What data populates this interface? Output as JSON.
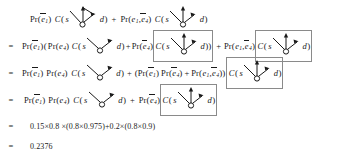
{
  "document": {
    "kind": "mathematical-derivation",
    "ink_color": "#1a1a1a",
    "box_color": "#8a8a8a",
    "background": "#ffffff"
  },
  "symbols": {
    "pr": "Pr",
    "c": "C",
    "e": "e",
    "s": "s",
    "d": "d",
    "sub_1": "1",
    "sub_4": "4",
    "equals": "=",
    "plus": "+",
    "times": "×",
    "comma": ",",
    "lparen": "(",
    "rparen": ")"
  },
  "lines": [
    {
      "id": "line-1",
      "relation": "",
      "text": "Pr(ē1) C( s ↘○↗ d) + Pr(e1,ē4) C( s ↘○↑↗ d)"
    },
    {
      "id": "line-2",
      "relation": "=",
      "text": "Pr(ē1)( Pr(e4) C( s ↘○↗ d)+ Pr(ē4)|C( s ↘○↑↗ d)| ) + Pr(e1,ē4)|C( s ↘○↑↗ d)|"
    },
    {
      "id": "line-3",
      "relation": "=",
      "text": "Pr(ē1) Pr(e4) C( s ↘○↗ d) + (Pr(ē1) Pr(ē4) + Pr(e1,ē4)) C( s ↘○↑↗ d)"
    },
    {
      "id": "line-4",
      "relation": "=",
      "text": "Pr(ē1) Pr(e4) C( s ↘○↗ d) + Pr(ē4) C( s ↘○↑↗ d)"
    },
    {
      "id": "line-5",
      "relation": "=",
      "text": "0.15×0.8 ×(0.8×0.975)+0.2×(0.8×0.9)"
    },
    {
      "id": "line-6",
      "relation": "=",
      "text": "0.2376"
    }
  ],
  "numeric": {
    "expression": "0.15×0.8 ×(0.8×0.975)+0.2×(0.8×0.9)",
    "result": "0.2376",
    "factors": [
      "0.15",
      "0.8",
      "0.8",
      "0.975",
      "0.2",
      "0.8",
      "0.9"
    ]
  },
  "graphs": {
    "triangle": {
      "name": "triangle-graph",
      "source_label": "s",
      "dest_label": "d",
      "node": "○",
      "arrows": [
        "s-down-right",
        "up",
        "up-right-to-d",
        "diagonal-cross"
      ]
    },
    "vee": {
      "name": "vee-graph",
      "source_label": "s",
      "dest_label": "d",
      "node": "○",
      "arrows": [
        "s-down-right",
        "up-right-to-d"
      ]
    },
    "fan": {
      "name": "fan-graph",
      "source_label": "s",
      "dest_label": "d",
      "node": "○",
      "arrows": [
        "s-down-right",
        "up",
        "up-right-to-d"
      ]
    }
  }
}
